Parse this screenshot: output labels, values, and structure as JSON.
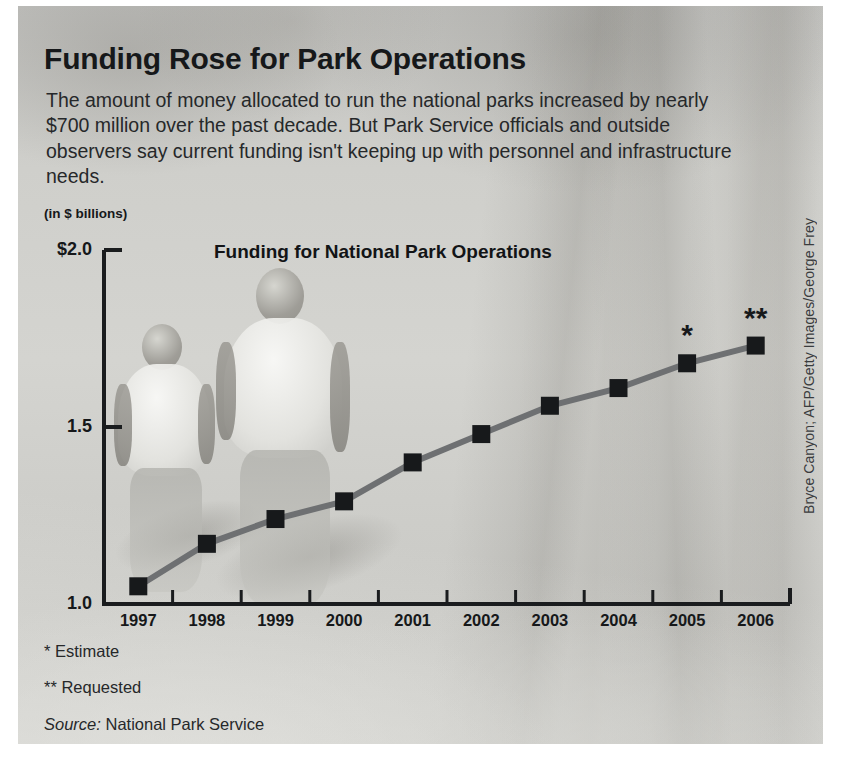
{
  "headline": "Funding Rose for Park Operations",
  "deck": "The amount of money allocated to run the national parks increased by nearly $700 million over the past decade. But Park Service officials and outside observers say current funding isn't keeping up with personnel and infrastructure needs.",
  "units_label": "(in $ billions)",
  "credit": "Bryce Canyon; AFP/Getty Images/George Frey",
  "footnotes": {
    "estimate": "* Estimate",
    "requested": "** Requested",
    "source_label": "Source:",
    "source_value": " National Park Service"
  },
  "colors": {
    "ink": "#16181a",
    "axis": "#1a1c1e",
    "line": "#6e7072",
    "marker": "#17191b",
    "panel_bg": "#c9c9c6"
  },
  "chart_data": {
    "type": "line",
    "title": "Funding for National Park Operations",
    "xlabel": "",
    "ylabel": "(in $ billions)",
    "categories": [
      "1997",
      "1998",
      "1999",
      "2000",
      "2001",
      "2002",
      "2003",
      "2004",
      "2005",
      "2006"
    ],
    "values": [
      1.05,
      1.17,
      1.24,
      1.29,
      1.4,
      1.48,
      1.56,
      1.61,
      1.68,
      1.73
    ],
    "point_annotations": [
      "",
      "",
      "",
      "",
      "",
      "",
      "",
      "",
      "*",
      "**"
    ],
    "ylim": [
      1.0,
      2.0
    ],
    "ytick_labels": [
      "$2.0",
      "1.5",
      "1.0"
    ],
    "ytick_values": [
      2.0,
      1.5,
      1.0
    ],
    "grid": false,
    "legend": false,
    "marker": "square",
    "notes": [
      "* Estimate",
      "** Requested"
    ],
    "source": "National Park Service"
  }
}
